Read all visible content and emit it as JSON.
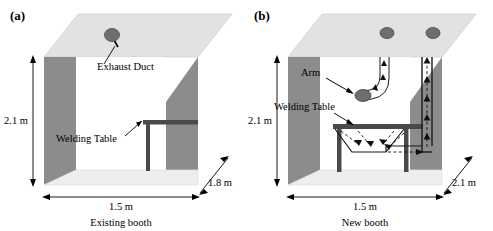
{
  "figure": {
    "panels": [
      {
        "tag": "(a)",
        "caption": "Existing booth",
        "dimensions": {
          "height": "2.1 m",
          "width": "1.5 m",
          "depth": "1.8 m"
        },
        "labels": {
          "exhaust_duct": "Exhaust Duct",
          "welding_table": "Welding Table"
        },
        "components": [
          "ceiling-exhaust-duct",
          "welding-table",
          "left-wall",
          "right-wall",
          "back-wall",
          "ceiling",
          "floor"
        ]
      },
      {
        "tag": "(b)",
        "caption": "New booth",
        "dimensions": {
          "height": "2.1 m",
          "width": "1.5 m",
          "depth": "2.1 m"
        },
        "labels": {
          "arm": "Arm",
          "welding_table": "Welding Table"
        },
        "components": [
          "ceiling-exhaust-duct-left",
          "ceiling-exhaust-duct-right",
          "extraction-arm",
          "downdraft-welding-table",
          "return-duct",
          "airflow-arrows",
          "left-wall",
          "right-wall",
          "back-wall",
          "ceiling",
          "floor"
        ]
      }
    ],
    "colors": {
      "side_wall": "#8c8c8c",
      "ceiling": "#e2e2e2",
      "floor": "#eeeeee",
      "back_wall": "#ffffff",
      "duct_fill": "#6e6e6e",
      "table": "#4a4a4a",
      "outline": "#000000",
      "arrow": "#111111"
    }
  }
}
